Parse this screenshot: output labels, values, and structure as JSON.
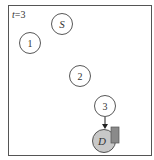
{
  "label": "t = 3",
  "label_var": "t",
  "label_val": "=3",
  "nodes": {
    "source": "S",
    "n1": "1",
    "n2": "2",
    "n3": "3",
    "dest": "D"
  },
  "colors": {
    "frame": "#555555",
    "dest_fill": "#c8c8c8",
    "block_fill": "#8a8a8a"
  }
}
